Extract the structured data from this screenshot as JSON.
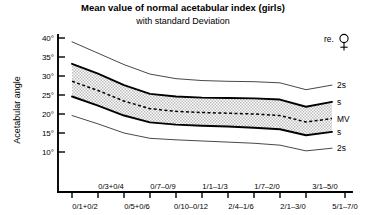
{
  "chart_data": {
    "type": "line",
    "title": "Mean value of normal acetabular index (girls)",
    "subtitle": "with standard Deviation",
    "xlabel": "",
    "ylabel": "Acetabular angle",
    "ylim": [
      5,
      42
    ],
    "yticks": [
      40,
      35,
      30,
      25,
      20,
      15,
      10
    ],
    "ytick_labels": [
      "40°",
      "35°",
      "30°",
      "25°",
      "20°",
      "15°",
      "10°"
    ],
    "grid": false,
    "legend_position": "right",
    "sex_marker": "re.♀",
    "sex_marker_text": "re.",
    "x_categories_upper": [
      "0/3+0/4",
      "0/7–0/9",
      "1/1–1/3",
      "1/7–2/0",
      "3/1–5/0"
    ],
    "x_categories_lower": [
      "0/1+0/2",
      "0/5+0/6",
      "0/10–0/12",
      "2/4–1/6",
      "2/1–3/0",
      "5/1–7/0"
    ],
    "x_index": [
      0,
      1,
      2,
      3,
      4,
      5,
      6,
      7,
      8,
      9,
      10
    ],
    "series": [
      {
        "name": "2s",
        "label": "2s",
        "kind": "upper-2s",
        "values": [
          39.0,
          36.0,
          33.0,
          30.5,
          29.3,
          28.8,
          28.6,
          28.5,
          28.2,
          26.4,
          27.6
        ]
      },
      {
        "name": "s",
        "label": "s",
        "kind": "upper-1s",
        "values": [
          33.2,
          30.6,
          27.6,
          25.3,
          24.6,
          24.3,
          24.2,
          24.1,
          23.8,
          21.9,
          23.2
        ]
      },
      {
        "name": "MV",
        "label": "MV",
        "kind": "mean",
        "values": [
          28.6,
          26.2,
          23.4,
          21.4,
          20.7,
          20.4,
          20.2,
          20.0,
          19.6,
          17.9,
          18.8
        ]
      },
      {
        "name": "s",
        "label": "s",
        "kind": "lower-1s",
        "values": [
          24.6,
          22.2,
          19.6,
          17.8,
          17.2,
          16.9,
          16.7,
          16.4,
          16.0,
          14.4,
          15.3
        ]
      },
      {
        "name": "2s",
        "label": "2s",
        "kind": "lower-2s",
        "values": [
          19.6,
          17.4,
          15.0,
          13.6,
          13.2,
          12.9,
          12.6,
          12.3,
          11.8,
          10.3,
          11.0
        ]
      }
    ],
    "legend_entries": [
      "2s",
      "s",
      "MV",
      "s",
      "2s"
    ],
    "band_fill_color": "#d9d9d9",
    "line_color": "#000000"
  }
}
